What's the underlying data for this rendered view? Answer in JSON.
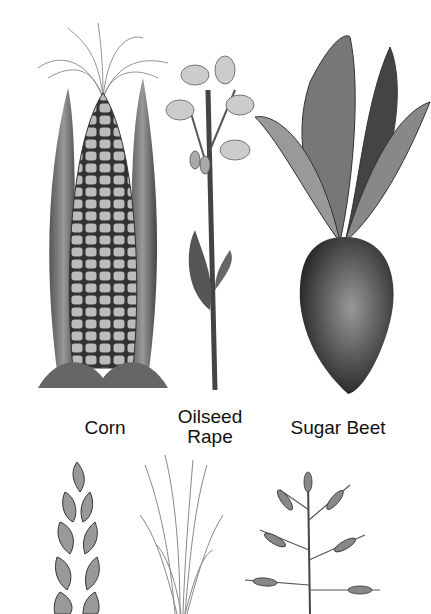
{
  "illustration": {
    "style": "pencil botanical drawing",
    "plants": [
      {
        "name": "corn",
        "label": "Corn"
      },
      {
        "name": "oilseed-rape",
        "label_line1": "Oilseed",
        "label_line2": "Rape"
      },
      {
        "name": "sugar-beet",
        "label": "Sugar Beet"
      },
      {
        "name": "wheat-ear",
        "label": ""
      },
      {
        "name": "grass",
        "label": ""
      },
      {
        "name": "oat",
        "label": ""
      }
    ]
  }
}
